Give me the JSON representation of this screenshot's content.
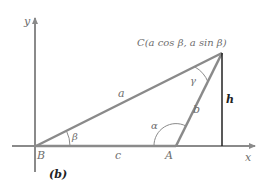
{
  "figure": {
    "caption": "(b)",
    "axes": {
      "x_label": "x",
      "y_label": "y"
    },
    "points": {
      "B": "B",
      "A": "A",
      "C": "C(a cos β, a sin β)"
    },
    "sides": {
      "a": "a",
      "b": "b",
      "c": "c",
      "h": "h"
    },
    "angles": {
      "alpha": "α",
      "beta": "β",
      "gamma": "γ"
    },
    "colors": {
      "triangle_line": "#8a8a8a",
      "axis_line": "#8a8a8a",
      "height_line": "#222222",
      "label_text": "#6e6e6e"
    }
  }
}
